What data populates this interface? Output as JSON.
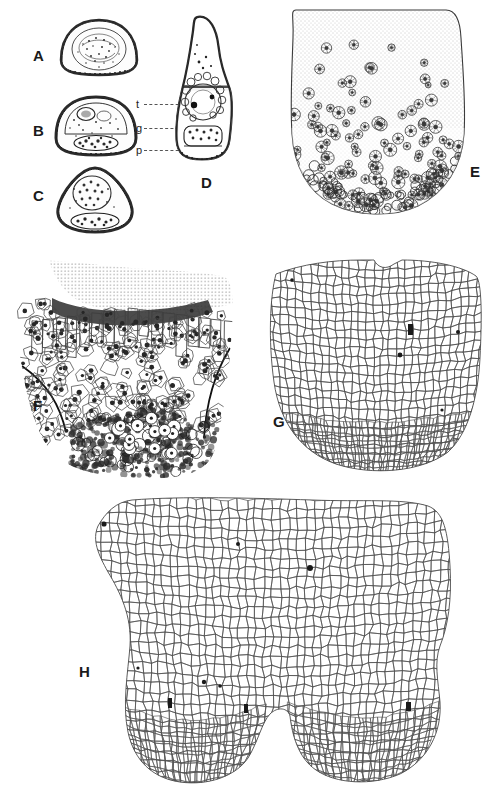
{
  "figure": {
    "kind": "scientific-plate",
    "caption": "",
    "background_color": "#ffffff",
    "ink_color": "#2b2b2b",
    "width": 496,
    "height": 800
  },
  "panels": [
    {
      "id": "A",
      "label": "A",
      "label_x": 33,
      "label_y": 48,
      "description": "Transverse section of shoot apex, dome-shaped outline with dark outer rim and stippled interior",
      "shape": "dome",
      "x": 58,
      "y": 16,
      "w": 80,
      "h": 62,
      "rim": true,
      "texture": "stipple-dense"
    },
    {
      "id": "B",
      "label": "B",
      "label_x": 33,
      "label_y": 123,
      "description": "Transverse section showing internal tissue zones t, g and p with heavy outer rim",
      "shape": "dome",
      "x": 52,
      "y": 92,
      "w": 86,
      "h": 66,
      "rim": true,
      "texture": "stipple-zones"
    },
    {
      "id": "C",
      "label": "C",
      "label_x": 33,
      "label_y": 188,
      "description": "Transverse section, triangular-rounded outline with granular central mass",
      "shape": "triangle-round",
      "x": 52,
      "y": 163,
      "w": 84,
      "h": 72,
      "rim": true,
      "texture": "stipple-core"
    },
    {
      "id": "D",
      "label": "D",
      "label_x": 201,
      "label_y": 175,
      "description": "Longitudinal section, elongate flask-shaped apex with circular bodies and dark granules",
      "shape": "flask",
      "x": 170,
      "y": 12,
      "w": 66,
      "h": 152,
      "rim": true,
      "texture": "bodies-granules"
    },
    {
      "id": "E",
      "label": "E",
      "label_x": 470,
      "label_y": 164,
      "description": "Low magnification section of apex, finely stippled ground tissue with scattered dark cell clusters increasing toward base",
      "shape": "blunt-apex",
      "x": 268,
      "y": 8,
      "w": 206,
      "h": 212,
      "rim": false,
      "texture": "stipple-clusters"
    },
    {
      "id": "F",
      "label": "F",
      "label_x": 33,
      "label_y": 398,
      "description": "High magnification of apex showing outlined cells with conspicuous dark nuclei and a dense basal zone",
      "shape": "tapered-apex",
      "x": 8,
      "y": 256,
      "w": 228,
      "h": 222,
      "rim": false,
      "texture": "nucleated-cells"
    },
    {
      "id": "G",
      "label": "G",
      "label_x": 273,
      "label_y": 414,
      "description": "Cell-outline map of apex, anticlinal and periclinal wall pattern with a few marked cells",
      "shape": "rounded-apex",
      "x": 262,
      "y": 258,
      "w": 222,
      "h": 216,
      "rim": false,
      "texture": "cell-map"
    },
    {
      "id": "H",
      "label": "H",
      "label_x": 79,
      "label_y": 664,
      "description": "Large cell-outline map of a bilobed apex with central notch and marked cells",
      "shape": "bilobed",
      "x": 72,
      "y": 496,
      "w": 398,
      "h": 290,
      "rim": false,
      "texture": "cell-map-large"
    }
  ],
  "annotations": [
    {
      "id": "t",
      "label": "t",
      "x": 136,
      "y": 100,
      "leader_x": 144,
      "leader_y": 104,
      "leader_w": 40,
      "description": "tunica layer"
    },
    {
      "id": "g",
      "label": "g",
      "x": 136,
      "y": 124,
      "leader_x": 144,
      "leader_y": 128,
      "leader_w": 40,
      "description": "generative / central zone"
    },
    {
      "id": "p",
      "label": "p",
      "x": 136,
      "y": 146,
      "leader_x": 144,
      "leader_y": 150,
      "leader_w": 40,
      "description": "procambial strand"
    }
  ]
}
